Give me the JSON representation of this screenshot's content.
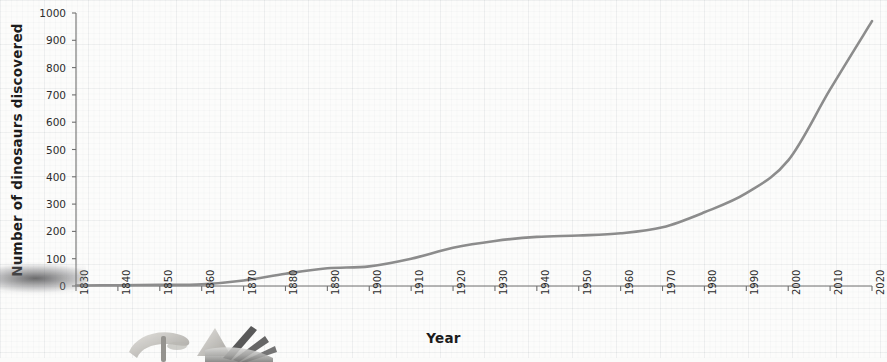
{
  "chart_data": {
    "type": "line",
    "title": "",
    "xlabel": "Year",
    "ylabel": "Number of dinosaurs discovered",
    "xlim": [
      1830,
      2020
    ],
    "ylim": [
      0,
      1000
    ],
    "grid": true,
    "legend": null,
    "line_color": "#8c8c8c",
    "x": [
      1830,
      1840,
      1850,
      1860,
      1870,
      1880,
      1890,
      1900,
      1910,
      1920,
      1930,
      1940,
      1950,
      1960,
      1970,
      1980,
      1990,
      2000,
      2010,
      2020
    ],
    "values": [
      2,
      3,
      4,
      6,
      20,
      45,
      65,
      72,
      100,
      140,
      165,
      180,
      185,
      193,
      215,
      270,
      340,
      460,
      720,
      970
    ],
    "xticks": [
      "1830",
      "1840",
      "1850",
      "1860",
      "1870",
      "1880",
      "1890",
      "1900",
      "1910",
      "1920",
      "1930",
      "1940",
      "1950",
      "1960",
      "1970",
      "1980",
      "1990",
      "2000",
      "2010",
      "2020"
    ],
    "yticks": [
      "0",
      "100",
      "200",
      "300",
      "400",
      "500",
      "600",
      "700",
      "800",
      "900",
      "1000"
    ],
    "series": [
      {
        "name": "Dinosaurs discovered",
        "values": [
          2,
          3,
          4,
          6,
          20,
          45,
          65,
          72,
          100,
          140,
          165,
          180,
          185,
          193,
          215,
          270,
          340,
          460,
          720,
          970
        ]
      }
    ]
  },
  "decoration": {
    "left_photo_name": "fossil-photo-left-edge",
    "bottom_photo_name": "excavation-tools-photo"
  }
}
